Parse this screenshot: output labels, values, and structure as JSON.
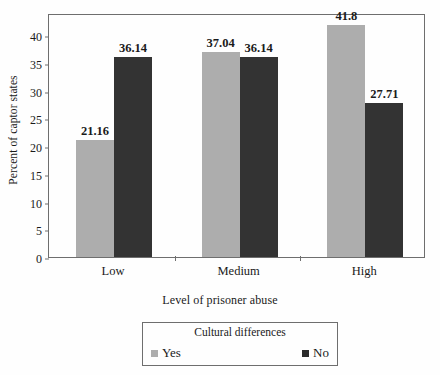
{
  "chart_data": {
    "type": "bar",
    "title": "",
    "subtitle": "",
    "xlabel": "Level of prisoner abuse",
    "ylabel": "Percent of captor states",
    "categories": [
      "Low",
      "Medium",
      "High"
    ],
    "series": [
      {
        "name": "Yes",
        "color": "#adadad",
        "values": [
          21.16,
          37.04,
          41.8
        ],
        "labels": [
          "21.16",
          "37.04",
          "41.8"
        ]
      },
      {
        "name": "No",
        "color": "#333333",
        "values": [
          36.14,
          36.14,
          27.71
        ],
        "labels": [
          "36.14",
          "36.14",
          "27.71"
        ]
      }
    ],
    "ylim": [
      0,
      44
    ],
    "yticks": [
      0,
      5,
      10,
      15,
      20,
      25,
      30,
      35,
      40
    ],
    "ytick_labels": [
      "0",
      "5",
      "10",
      "15",
      "20",
      "25",
      "30",
      "35",
      "40"
    ],
    "grid": false,
    "data_labels": true,
    "legend": {
      "position": "bottom",
      "title": "Cultural differences",
      "entries": [
        {
          "label": "Yes",
          "color": "#adadad"
        },
        {
          "label": "No",
          "color": "#2b2b2b"
        }
      ]
    }
  },
  "colors": {
    "series_yes": "#adadad",
    "series_no": "#333333",
    "axis": "#6e6e6e",
    "text": "#1a1a1a",
    "background": "#fefefe"
  }
}
